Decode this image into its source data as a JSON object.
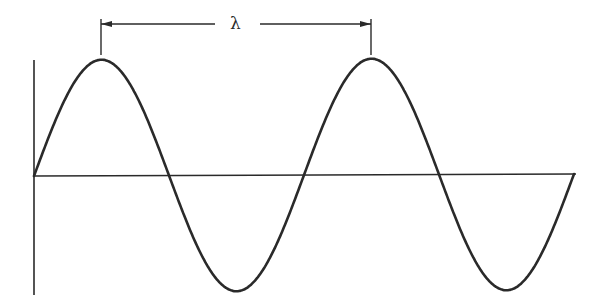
{
  "diagram": {
    "title": "",
    "type": "sine-wave-wavelength",
    "wavelength_label": "λ",
    "colors": {
      "stroke": "#2a2a2a",
      "background": "#ffffff"
    },
    "axes": {
      "vertical": {
        "x": 34,
        "y_top": 60,
        "y_bottom": 295
      },
      "horizontal": {
        "y": 176,
        "x_start": 34,
        "x_end": 576
      }
    },
    "wave": {
      "origin_x": 34,
      "baseline_y": 176,
      "wavelength_px": 270,
      "amplitude_px": 116,
      "cycles": 2,
      "key_points": [
        {
          "name": "start",
          "x": 34,
          "y": 176
        },
        {
          "name": "peak-1",
          "x": 101,
          "y": 60
        },
        {
          "name": "crossing-1",
          "x": 167,
          "y": 176
        },
        {
          "name": "trough-1",
          "x": 236,
          "y": 294
        },
        {
          "name": "crossing-2",
          "x": 303,
          "y": 176
        },
        {
          "name": "peak-2",
          "x": 371,
          "y": 60
        },
        {
          "name": "crossing-3",
          "x": 439,
          "y": 176
        },
        {
          "name": "trough-2",
          "x": 508,
          "y": 292
        },
        {
          "name": "end",
          "x": 576,
          "y": 174
        }
      ]
    },
    "dimension": {
      "y": 24,
      "x_left": 101,
      "x_right": 371,
      "tick_top": 19,
      "tick_bottom": 55,
      "gap_left": 215,
      "gap_right": 260,
      "label_x": 230,
      "label_y": 15
    }
  }
}
